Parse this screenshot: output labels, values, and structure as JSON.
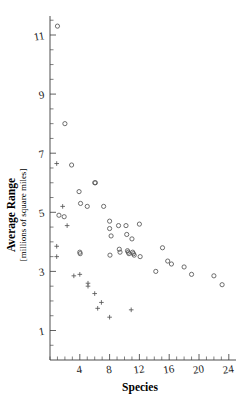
{
  "chart_data": {
    "type": "scatter",
    "title": "",
    "xlabel": "Species",
    "ylabel": "Average Range",
    "ylabel_units": "[millions of square miles]",
    "xlim": [
      0,
      25
    ],
    "ylim": [
      0.2,
      11.6
    ],
    "grid": false,
    "legend": "none",
    "xticks": [
      4,
      8,
      12,
      16,
      20,
      24
    ],
    "xtick_labels": [
      "4",
      "8",
      "12",
      "16",
      "20",
      "24"
    ],
    "yticks": [
      1,
      3,
      5,
      7,
      9,
      11
    ],
    "ytick_labels": [
      "1",
      "3",
      "5",
      "7",
      "9",
      "11"
    ],
    "x_minor_step": 1,
    "y_minor_step": 0.5,
    "series": [
      {
        "name": "circles",
        "marker": "circle",
        "color": "#555555",
        "points": [
          [
            1.0,
            11.3
          ],
          [
            2.0,
            8.0
          ],
          [
            2.9,
            6.6
          ],
          [
            1.2,
            4.9
          ],
          [
            1.9,
            4.85
          ],
          [
            3.9,
            5.7
          ],
          [
            4.1,
            5.3
          ],
          [
            5.0,
            5.2
          ],
          [
            6.0,
            6.0
          ],
          [
            6.1,
            6.0
          ],
          [
            7.2,
            5.2
          ],
          [
            8.0,
            4.7
          ],
          [
            8.0,
            4.45
          ],
          [
            8.2,
            4.2
          ],
          [
            9.2,
            4.55
          ],
          [
            9.3,
            3.75
          ],
          [
            9.4,
            3.65
          ],
          [
            10.2,
            4.55
          ],
          [
            10.3,
            4.25
          ],
          [
            10.4,
            3.7
          ],
          [
            10.5,
            3.65
          ],
          [
            10.6,
            3.6
          ],
          [
            11.0,
            4.1
          ],
          [
            11.1,
            3.65
          ],
          [
            11.2,
            3.6
          ],
          [
            11.3,
            3.55
          ],
          [
            12.0,
            4.6
          ],
          [
            12.1,
            3.5
          ],
          [
            4.0,
            3.65
          ],
          [
            4.05,
            3.6
          ],
          [
            8.05,
            3.55
          ],
          [
            14.2,
            3.0
          ],
          [
            15.1,
            3.8
          ],
          [
            15.8,
            3.35
          ],
          [
            16.3,
            3.25
          ],
          [
            18.0,
            3.15
          ],
          [
            19.0,
            2.9
          ],
          [
            22.0,
            2.85
          ],
          [
            23.1,
            2.55
          ]
        ]
      },
      {
        "name": "plus",
        "marker": "plus",
        "color": "#555555",
        "points": [
          [
            0.9,
            6.65
          ],
          [
            1.7,
            5.2
          ],
          [
            2.3,
            4.55
          ],
          [
            0.9,
            3.85
          ],
          [
            0.9,
            3.5
          ],
          [
            3.2,
            2.85
          ],
          [
            4.0,
            2.9
          ],
          [
            5.1,
            2.6
          ],
          [
            5.1,
            2.5
          ],
          [
            6.0,
            2.25
          ],
          [
            6.9,
            1.95
          ],
          [
            6.4,
            1.75
          ],
          [
            8.0,
            1.45
          ],
          [
            10.9,
            1.7
          ]
        ]
      }
    ]
  }
}
